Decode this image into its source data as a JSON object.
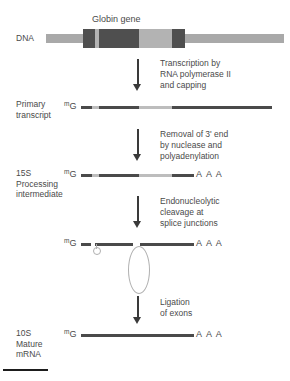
{
  "figure": {
    "gene_title": "Globin gene",
    "rows": [
      {
        "id": "dna",
        "label": "DNA",
        "cap": "",
        "polya": ""
      },
      {
        "id": "primary-transcript",
        "label": "Primary\ntranscript",
        "cap_sup": "m",
        "cap": "G",
        "polya": ""
      },
      {
        "id": "processing-intermediate",
        "label": "15S\nProcessing\nintermediate",
        "cap_sup": "m",
        "cap": "G",
        "polya": "A A A"
      },
      {
        "id": "spliced-lariat",
        "label": "",
        "cap_sup": "m",
        "cap": "G",
        "polya": "A A A"
      },
      {
        "id": "mature-mrna",
        "label": "10S\nMature\nmRNA",
        "cap_sup": "m",
        "cap": "G",
        "polya": "A A A"
      }
    ],
    "steps": [
      {
        "id": "transcription",
        "text": "Transcription by\nRNA polymerase II\nand capping"
      },
      {
        "id": "cleavage-polyadenylation",
        "text": "Removal of 3' end\nby nuclease and\npolyadenylation"
      },
      {
        "id": "endonucleolytic-cleavage",
        "text": "Endonucleolytic\ncleavage at\nsplice junctions"
      },
      {
        "id": "ligation",
        "text": "Ligation\nof exons"
      }
    ],
    "colors": {
      "dna_flank": "#a9a9a9",
      "exon_dark": "#4f4f4f",
      "intron_light": "#bdbdbd",
      "rna_dark": "#4a4a4a",
      "lariat_stroke": "#b0b0b0",
      "arrow": "#3a3a3a",
      "text": "#4a4a4a",
      "rule": "#1d1d1d"
    }
  }
}
